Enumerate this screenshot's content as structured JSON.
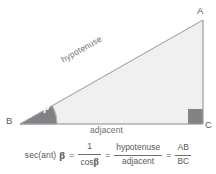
{
  "figure": {
    "colors": {
      "triangle_fill": "#f0f0f0",
      "triangle_stroke": "#a7a9ac",
      "angle_wedge": "#808285",
      "right_angle_marker": "#808285",
      "text": "#58595b",
      "label_text": "#6d6e71",
      "background": "#ffffff"
    },
    "vertices": {
      "a": "A",
      "b": "B",
      "c": "C"
    },
    "sides": {
      "hypotenuse": "hypotenuse",
      "adjacent": "adjacent"
    },
    "angle": {
      "symbol": "β"
    }
  },
  "formula": {
    "function_name": "sec(ant)",
    "angle_symbol": "β",
    "equals": "=",
    "fraction_1": {
      "numerator": "1",
      "denominator_text": "cos",
      "denominator_symbol": "β"
    },
    "fraction_2": {
      "numerator": "hypotenuse",
      "denominator": "adjacent"
    },
    "fraction_3": {
      "numerator": "AB",
      "denominator": "BC"
    }
  }
}
